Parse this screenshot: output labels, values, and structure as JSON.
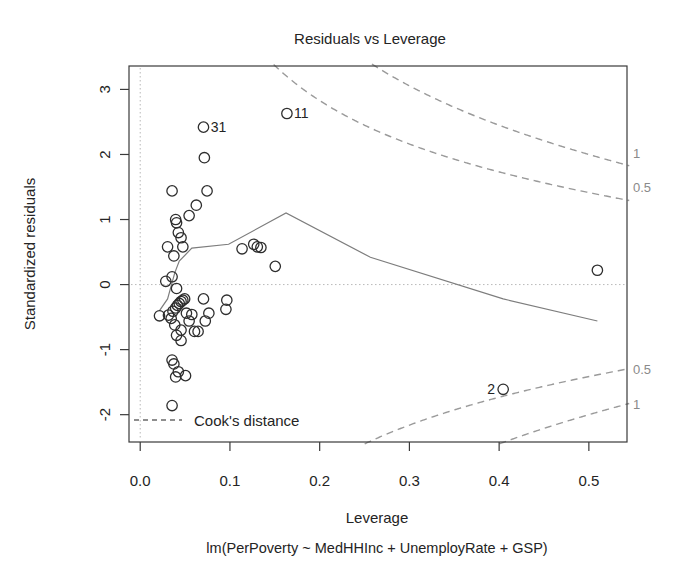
{
  "chart_data": {
    "type": "scatter",
    "title": "Residuals vs Leverage",
    "xlabel": "Leverage",
    "sublabel": "lm(PerPoverty ~ MedHHInc + UnemployRate + GSP)",
    "ylabel": "Standardized residuals",
    "xlim": [
      -0.0125,
      0.5425
    ],
    "ylim": [
      -2.42,
      3.36
    ],
    "xticks": [
      0.0,
      0.1,
      0.2,
      0.3,
      0.4,
      0.5
    ],
    "xtick_labels": [
      "0.0",
      "0.1",
      "0.2",
      "0.3",
      "0.4",
      "0.5"
    ],
    "yticks": [
      3,
      2,
      1,
      0,
      -1,
      -2
    ],
    "ytick_labels": [
      "3",
      "2",
      "1",
      "0",
      "-1",
      "-2"
    ],
    "grid": false,
    "reference_lines": {
      "h": 0,
      "v": 0
    },
    "legend": "Cook's distance",
    "legend_position": "bottom-left",
    "cooks_contour_labels": [
      {
        "text": "1",
        "cook": 1,
        "side": "upper"
      },
      {
        "text": "0.5",
        "cook": 0.5,
        "side": "upper"
      },
      {
        "text": "0.5",
        "cook": 0.5,
        "side": "lower"
      },
      {
        "text": "1",
        "cook": 1,
        "side": "lower"
      }
    ],
    "point_labels": [
      {
        "id": "11",
        "x": 0.1635,
        "y": 2.63
      },
      {
        "id": "31",
        "x": 0.0705,
        "y": 2.42
      },
      {
        "id": "2",
        "x": 0.4045,
        "y": -1.61
      }
    ],
    "x": [
      0.1635,
      0.0705,
      0.4045,
      0.0715,
      0.0355,
      0.0625,
      0.0745,
      0.0545,
      0.0305,
      0.0395,
      0.0405,
      0.0425,
      0.0455,
      0.0475,
      0.0285,
      0.0355,
      0.0405,
      0.0215,
      0.0315,
      0.0345,
      0.0365,
      0.0395,
      0.0415,
      0.0435,
      0.0455,
      0.0475,
      0.0495,
      0.0515,
      0.0545,
      0.0575,
      0.0605,
      0.0645,
      0.0705,
      0.0725,
      0.0765,
      0.0405,
      0.0455,
      0.0355,
      0.0375,
      0.0505,
      0.0395,
      0.0425,
      0.0355,
      0.0385,
      0.0455,
      0.0375,
      0.1265,
      0.1305,
      0.1345,
      0.1135,
      0.1505,
      0.5095,
      0.0955,
      0.0965
    ],
    "y": [
      2.63,
      2.42,
      -1.61,
      1.95,
      1.44,
      1.22,
      1.44,
      1.06,
      0.58,
      1.0,
      0.95,
      0.8,
      0.72,
      0.58,
      0.05,
      0.12,
      -0.06,
      -0.48,
      -0.47,
      -0.52,
      -0.41,
      -0.36,
      -0.32,
      -0.29,
      -0.26,
      -0.24,
      -0.22,
      -0.44,
      -0.56,
      -0.46,
      -0.72,
      -0.72,
      -0.22,
      -0.56,
      -0.44,
      -0.78,
      -0.86,
      -1.16,
      -1.22,
      -1.4,
      -1.42,
      -1.34,
      -1.86,
      -0.62,
      -0.7,
      0.44,
      0.62,
      0.58,
      0.57,
      0.55,
      0.28,
      0.22,
      -0.38,
      -0.24
    ],
    "smoother": {
      "x": [
        0.0215,
        0.0305,
        0.0385,
        0.0435,
        0.0575,
        0.0985,
        0.1625,
        0.2565,
        0.4045,
        0.5095
      ],
      "y": [
        -0.4,
        -0.22,
        0.18,
        0.36,
        0.56,
        0.62,
        1.1,
        0.42,
        -0.22,
        -0.56
      ]
    }
  },
  "geometry": {
    "frame": {
      "left": 129,
      "top": 66,
      "right": 627,
      "bottom": 442
    },
    "title_y": 44,
    "xlabel_y": 523,
    "sublabel_y": 553,
    "xtick_label_y": 486,
    "point_radius": 5.2
  }
}
